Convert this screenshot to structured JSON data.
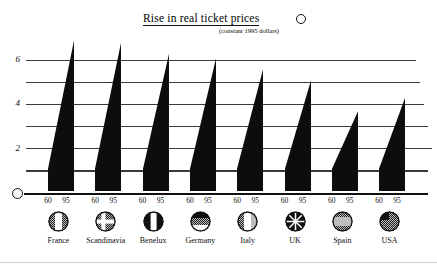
{
  "header": {
    "title": "Rise in real ticket prices",
    "subtitle": "(constant 1995 dollars)",
    "knob_icon": "circle-marker-icon"
  },
  "axis": {
    "origin_icon": "circle-origin-icon",
    "y_tick_labels": [
      "6",
      "4",
      "2"
    ],
    "x_year_start": "60",
    "x_year_end": "95"
  },
  "chart_data": {
    "type": "bar",
    "title": "Rise in real ticket prices",
    "subtitle": "(constant 1995 dollars)",
    "xlabel": "",
    "ylabel": "",
    "ylim": [
      0,
      7
    ],
    "grid": true,
    "gridlines": [
      1,
      2,
      3,
      4,
      5,
      6
    ],
    "labeled_ticks": [
      2,
      4,
      6
    ],
    "legend": "none",
    "x": [
      "60",
      "95"
    ],
    "note": "Each country is drawn as a filled wedge rising from the 1960 value to the 1995 value.",
    "categories": [
      "France",
      "Scandinavia",
      "Benelux",
      "Germany",
      "Italy",
      "UK",
      "Spain",
      "USA"
    ],
    "series": [
      {
        "name": "60",
        "values": [
          1.0,
          1.0,
          1.0,
          1.0,
          1.0,
          1.0,
          1.0,
          1.0
        ]
      },
      {
        "name": "95",
        "values": [
          6.8,
          6.7,
          6.2,
          6.0,
          5.5,
          5.0,
          3.6,
          4.2
        ]
      }
    ]
  },
  "countries": [
    {
      "name": "France",
      "flag_icon": "flag-france-icon",
      "v60": 1.0,
      "v95": 6.8
    },
    {
      "name": "Scandinavia",
      "flag_icon": "flag-scandinavia-icon",
      "v60": 1.0,
      "v95": 6.7
    },
    {
      "name": "Benelux",
      "flag_icon": "flag-benelux-icon",
      "v60": 1.0,
      "v95": 6.2
    },
    {
      "name": "Germany",
      "flag_icon": "flag-germany-icon",
      "v60": 1.0,
      "v95": 6.0
    },
    {
      "name": "Italy",
      "flag_icon": "flag-italy-icon",
      "v60": 1.0,
      "v95": 5.5
    },
    {
      "name": "UK",
      "flag_icon": "flag-uk-icon",
      "v60": 1.0,
      "v95": 5.0
    },
    {
      "name": "Spain",
      "flag_icon": "flag-spain-icon",
      "v60": 1.0,
      "v95": 3.6
    },
    {
      "name": "USA",
      "flag_icon": "flag-usa-icon",
      "v60": 1.0,
      "v95": 4.2
    }
  ],
  "colors": {
    "ink": "#111111",
    "grid": "#3a3a3a",
    "paper": "#ffffff"
  }
}
